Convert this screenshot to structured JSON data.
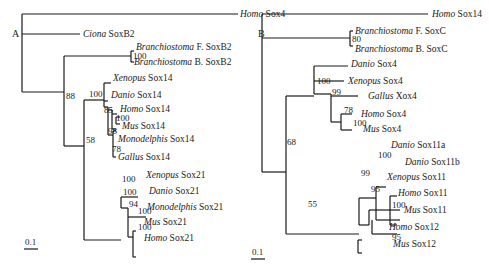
{
  "figure": {
    "panels": [
      {
        "id": "A",
        "label": "A",
        "label_pos": [
          12,
          37
        ],
        "scale": {
          "text": "0.1",
          "x": 25,
          "y": 245,
          "x1": 24,
          "x2": 38,
          "ly": 249
        },
        "lines": [
          [
            22,
            14,
            22,
            92
          ],
          [
            22,
            14,
            238,
            14
          ],
          [
            22,
            34,
            80,
            34
          ],
          [
            22,
            92,
            64,
            92
          ],
          [
            64,
            56,
            64,
            146
          ],
          [
            64,
            56,
            131,
            56
          ],
          [
            131,
            51,
            131,
            62
          ],
          [
            131,
            51,
            134,
            51
          ],
          [
            131,
            62,
            134,
            62
          ],
          [
            64,
            146,
            84,
            146
          ],
          [
            84,
            100,
            84,
            240
          ],
          [
            84,
            100,
            104,
            100
          ],
          [
            104,
            83,
            104,
            107
          ],
          [
            104,
            83,
            111,
            83
          ],
          [
            104,
            101,
            108,
            101
          ],
          [
            104,
            107,
            108,
            107
          ],
          [
            108,
            107,
            108,
            135
          ],
          [
            108,
            110,
            112,
            110
          ],
          [
            112,
            110,
            112,
            129
          ],
          [
            112,
            114,
            117,
            114
          ],
          [
            112,
            129,
            116,
            129
          ],
          [
            116,
            117,
            116,
            124
          ],
          [
            116,
            117,
            120,
            117
          ],
          [
            116,
            124,
            120,
            124
          ],
          [
            108,
            135,
            113,
            135
          ],
          [
            113,
            131,
            113,
            157
          ],
          [
            113,
            131,
            116,
            131
          ],
          [
            113,
            157,
            116,
            157
          ],
          [
            84,
            240,
            121,
            240
          ],
          [
            121,
            197,
            121,
            208
          ],
          [
            121,
            197,
            138,
            197
          ],
          [
            121,
            208,
            128,
            208
          ],
          [
            128,
            208,
            128,
            237
          ],
          [
            128,
            217,
            146,
            217
          ],
          [
            128,
            237,
            133,
            237
          ],
          [
            133,
            231,
            133,
            257
          ],
          [
            133,
            231,
            136,
            231
          ],
          [
            133,
            257,
            136,
            257
          ]
        ],
        "taxa": [
          {
            "genus": "Homo",
            "gene": " Sox4",
            "x": 240,
            "y": 17
          },
          {
            "genus": "Ciona",
            "gene": " SoxB2",
            "x": 83,
            "y": 37
          },
          {
            "genus": "Branchiostoma",
            "gene": " F. SoxB2",
            "x": 136,
            "y": 50
          },
          {
            "genus": "Branchiostoma",
            "gene": " B. SoxB2",
            "x": 134,
            "y": 65
          },
          {
            "genus": "Xenopus",
            "gene": " Sox14",
            "x": 113,
            "y": 81
          },
          {
            "genus": "Danio",
            "gene": " Sox14",
            "x": 111,
            "y": 98
          },
          {
            "genus": "Homo",
            "gene": " Sox14",
            "x": 120,
            "y": 112
          },
          {
            "genus": "Mus",
            "gene": " Sox14",
            "x": 122,
            "y": 129
          },
          {
            "genus": "Monodelphis",
            "gene": " Sox14",
            "x": 118,
            "y": 142
          },
          {
            "genus": "Gallus",
            "gene": " Sox14",
            "x": 118,
            "y": 160
          },
          {
            "genus": "Xenopus",
            "gene": " Sox21",
            "x": 146,
            "y": 178
          },
          {
            "genus": "Danio",
            "gene": " Sox21",
            "x": 149,
            "y": 194
          },
          {
            "genus": "Monodelphis",
            "gene": " Sox21",
            "x": 147,
            "y": 210
          },
          {
            "genus": "Mus",
            "gene": " Sox21",
            "x": 144,
            "y": 225
          },
          {
            "genus": "Homo",
            "gene": " Sox21",
            "x": 144,
            "y": 241
          }
        ],
        "bootstraps": [
          {
            "value": "100",
            "x": 133,
            "y": 59
          },
          {
            "value": "88",
            "x": 66,
            "y": 99
          },
          {
            "value": "100",
            "x": 89,
            "y": 97
          },
          {
            "value": "85",
            "x": 104,
            "y": 113
          },
          {
            "value": "100",
            "x": 116,
            "y": 121
          },
          {
            "value": "98",
            "x": 108,
            "y": 134
          },
          {
            "value": "78",
            "x": 112,
            "y": 152
          },
          {
            "value": "58",
            "x": 86,
            "y": 143
          },
          {
            "value": "100",
            "x": 122,
            "y": 182
          },
          {
            "value": "100",
            "x": 123,
            "y": 195
          },
          {
            "value": "94",
            "x": 129,
            "y": 207
          },
          {
            "value": "100",
            "x": 138,
            "y": 214
          },
          {
            "value": "100",
            "x": 138,
            "y": 230
          }
        ]
      },
      {
        "id": "B",
        "label": "B",
        "label_pos": [
          258,
          37
        ],
        "scale": {
          "text": "0.1",
          "x": 252,
          "y": 255,
          "x1": 251,
          "x2": 265,
          "ly": 259
        },
        "lines": [
          [
            262,
            14,
            262,
            172
          ],
          [
            262,
            14,
            428,
            14
          ],
          [
            262,
            38,
            350,
            38
          ],
          [
            350,
            31,
            350,
            46
          ],
          [
            350,
            31,
            353,
            31
          ],
          [
            350,
            46,
            353,
            46
          ],
          [
            262,
            172,
            286,
            172
          ],
          [
            286,
            96,
            286,
            234
          ],
          [
            286,
            96,
            314,
            96
          ],
          [
            314,
            66,
            314,
            81
          ],
          [
            314,
            66,
            348,
            66
          ],
          [
            314,
            81,
            344,
            81
          ],
          [
            314,
            81,
            314,
            94
          ],
          [
            314,
            94,
            331,
            94
          ],
          [
            331,
            94,
            331,
            122
          ],
          [
            331,
            96,
            358,
            96
          ],
          [
            331,
            122,
            341,
            122
          ],
          [
            341,
            114,
            341,
            130
          ],
          [
            341,
            114,
            352,
            114
          ],
          [
            341,
            130,
            352,
            130
          ],
          [
            286,
            234,
            359,
            234
          ],
          [
            359,
            198,
            359,
            225
          ],
          [
            359,
            198,
            376,
            198
          ],
          [
            376,
            187,
            376,
            220
          ],
          [
            376,
            187,
            386,
            187
          ],
          [
            376,
            220,
            381,
            220
          ],
          [
            381,
            220,
            400,
            220
          ],
          [
            359,
            225,
            369,
            225
          ],
          [
            369,
            210,
            369,
            225
          ],
          [
            369,
            210,
            400,
            210
          ],
          [
            372,
            220,
            372,
            234
          ],
          [
            372,
            234,
            397,
            234
          ],
          [
            390,
            196,
            390,
            225
          ],
          [
            390,
            196,
            397,
            196
          ],
          [
            390,
            225,
            397,
            225
          ],
          [
            358,
            240,
            358,
            253
          ],
          [
            358,
            240,
            362,
            240
          ],
          [
            358,
            253,
            362,
            253
          ]
        ],
        "taxa": [
          {
            "genus": "Homo",
            "gene": " Sox14",
            "x": 432,
            "y": 17
          },
          {
            "genus": "Branchiostoma",
            "gene": " F. SoxC",
            "x": 355,
            "y": 34
          },
          {
            "genus": "Branchiostoma",
            "gene": " B. SoxC",
            "x": 355,
            "y": 52
          },
          {
            "genus": "Danio",
            "gene": " Sox4",
            "x": 351,
            "y": 67
          },
          {
            "genus": "Xenopus",
            "gene": " Sox4",
            "x": 348,
            "y": 84
          },
          {
            "genus": "Gallus",
            "gene": " Xox4",
            "x": 368,
            "y": 99
          },
          {
            "genus": "Homo",
            "gene": " Sox4",
            "x": 361,
            "y": 117
          },
          {
            "genus": "Mus",
            "gene": " Sox4",
            "x": 363,
            "y": 132
          },
          {
            "genus": "Danio",
            "gene": " Sox11a",
            "x": 391,
            "y": 148
          },
          {
            "genus": "Danio",
            "gene": " Sox11b",
            "x": 405,
            "y": 165
          },
          {
            "genus": "Xenopus",
            "gene": " Sox11",
            "x": 387,
            "y": 180
          },
          {
            "genus": "Homo",
            "gene": " Sox11",
            "x": 398,
            "y": 196
          },
          {
            "genus": "Mus",
            "gene": " Sox11",
            "x": 404,
            "y": 213
          },
          {
            "genus": "Homo",
            "gene": " Sox12",
            "x": 389,
            "y": 230
          },
          {
            "genus": "Mus",
            "gene": " Sox12",
            "x": 393,
            "y": 247
          }
        ],
        "bootstraps": [
          {
            "value": "80",
            "x": 352,
            "y": 42
          },
          {
            "value": "100",
            "x": 317,
            "y": 84
          },
          {
            "value": "99",
            "x": 332,
            "y": 95
          },
          {
            "value": "78",
            "x": 344,
            "y": 113
          },
          {
            "value": "100",
            "x": 353,
            "y": 126
          },
          {
            "value": "68",
            "x": 287,
            "y": 145
          },
          {
            "value": "100",
            "x": 378,
            "y": 158
          },
          {
            "value": "99",
            "x": 361,
            "y": 176
          },
          {
            "value": "95",
            "x": 371,
            "y": 192
          },
          {
            "value": "100",
            "x": 392,
            "y": 208
          },
          {
            "value": "55",
            "x": 308,
            "y": 207
          },
          {
            "value": "95",
            "x": 392,
            "y": 240
          }
        ]
      }
    ]
  }
}
